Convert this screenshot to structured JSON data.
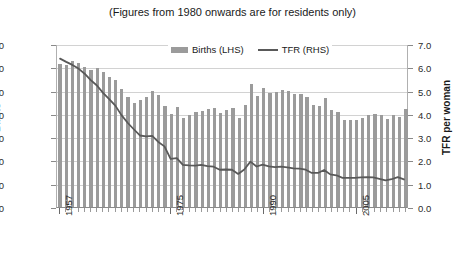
{
  "chart_data": {
    "type": "bar",
    "title": "(Figures from 1980 onwards are for residents only)",
    "xlabel": "",
    "ylabel": "Births",
    "y2label": "TFR per woman",
    "ylim": [
      0,
      70000
    ],
    "y2lim": [
      0,
      7.0
    ],
    "ytick_labels": [
      "70000",
      "60000",
      "50000",
      "40000",
      "30000",
      "20000",
      "10000",
      "0"
    ],
    "ytick_values": [
      70000,
      60000,
      50000,
      40000,
      30000,
      20000,
      10000,
      0
    ],
    "y2tick_labels": [
      "7.0",
      "6.0",
      "5.0",
      "4.0",
      "3.0",
      "2.0",
      "1.0",
      "0.0"
    ],
    "y2tick_values": [
      7.0,
      6.0,
      5.0,
      4.0,
      3.0,
      2.0,
      1.0,
      0.0
    ],
    "grid": true,
    "legend_position": "top-center",
    "xtick_labels": [
      "1957",
      "1975",
      "1990",
      "2005"
    ],
    "xtick_years": [
      1957,
      1975,
      1990,
      2005
    ],
    "categories": [
      1957,
      1958,
      1959,
      1960,
      1961,
      1962,
      1963,
      1964,
      1965,
      1966,
      1967,
      1968,
      1969,
      1970,
      1971,
      1972,
      1973,
      1974,
      1975,
      1976,
      1977,
      1978,
      1979,
      1980,
      1981,
      1982,
      1983,
      1984,
      1985,
      1986,
      1987,
      1988,
      1989,
      1990,
      1991,
      1992,
      1993,
      1994,
      1995,
      1996,
      1997,
      1998,
      1999,
      2000,
      2001,
      2002,
      2003,
      2004,
      2005,
      2006,
      2007,
      2008,
      2009,
      2010,
      2011,
      2012,
      2013
    ],
    "series": [
      {
        "name": "Births (LHS)",
        "axis": "left",
        "type": "bar",
        "color": "#9b9b9b",
        "values": [
          61490,
          60800,
          62500,
          61775,
          59930,
          58930,
          59500,
          58000,
          55725,
          54680,
          50560,
          47350,
          44540,
          45934,
          47088,
          49678,
          48269,
          43268,
          39948,
          42783,
          38363,
          39441,
          40779,
          41217,
          42250,
          42654,
          40585,
          41556,
          42484,
          38379,
          43616,
          52957,
          47669,
          51142,
          49114,
          49380,
          50225,
          49946,
          48635,
          48577,
          47333,
          43664,
          43336,
          46997,
          41451,
          40760,
          37485,
          37174,
          37492,
          38317,
          39490,
          39826,
          39570,
          37967,
          39654,
          38641,
          42000
        ]
      },
      {
        "name": "TFR (RHS)",
        "axis": "right",
        "type": "line",
        "color": "#595959",
        "values": [
          6.41,
          6.27,
          6.14,
          5.98,
          5.76,
          5.48,
          5.25,
          4.93,
          4.66,
          4.38,
          3.97,
          3.64,
          3.36,
          3.09,
          3.05,
          3.07,
          2.81,
          2.62,
          2.08,
          2.11,
          1.82,
          1.8,
          1.79,
          1.82,
          1.77,
          1.74,
          1.61,
          1.62,
          1.61,
          1.43,
          1.62,
          1.96,
          1.75,
          1.83,
          1.76,
          1.72,
          1.74,
          1.71,
          1.67,
          1.66,
          1.61,
          1.47,
          1.47,
          1.6,
          1.41,
          1.37,
          1.26,
          1.26,
          1.26,
          1.28,
          1.29,
          1.28,
          1.22,
          1.15,
          1.2,
          1.29,
          1.19
        ]
      }
    ]
  },
  "legend": {
    "items": [
      {
        "label": "Births (LHS)",
        "marker": "bar-swatch"
      },
      {
        "label": "TFR (RHS)",
        "marker": "line-swatch"
      }
    ]
  },
  "colors": {
    "bar": "#9b9b9b",
    "line": "#595959",
    "grid": "#d2d2d2",
    "axis": "#8a8a8a",
    "text": "#1a1a1a",
    "background": "#ffffff"
  }
}
